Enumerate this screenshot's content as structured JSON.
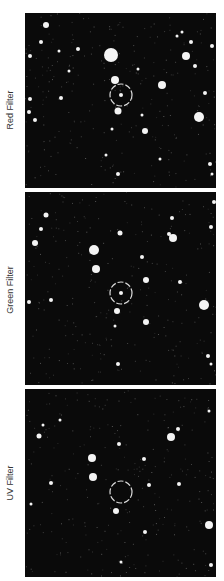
{
  "panels": [
    {
      "label": "Red Filter",
      "top": 13,
      "height": 175,
      "marker": {
        "cx": 96,
        "cy": 82,
        "r": 11
      },
      "stars": [
        [
          21,
          12,
          3
        ],
        [
          16,
          29,
          2
        ],
        [
          5,
          43,
          2
        ],
        [
          34,
          38,
          1.5
        ],
        [
          53,
          36,
          2
        ],
        [
          86,
          42,
          7
        ],
        [
          90,
          67,
          4
        ],
        [
          113,
          56,
          1.5
        ],
        [
          96,
          82,
          2
        ],
        [
          137,
          72,
          4
        ],
        [
          157,
          19,
          1.5
        ],
        [
          166,
          29,
          2
        ],
        [
          161,
          43,
          4
        ],
        [
          170,
          53,
          2
        ],
        [
          180,
          80,
          2
        ],
        [
          174,
          104,
          5
        ],
        [
          187,
          33,
          2
        ],
        [
          93,
          98,
          3.5
        ],
        [
          117,
          102,
          1.5
        ],
        [
          4,
          99,
          2
        ],
        [
          10,
          107,
          2
        ],
        [
          5,
          86,
          2
        ],
        [
          36,
          85,
          2
        ],
        [
          87,
          116,
          1.5
        ],
        [
          120,
          118,
          3
        ],
        [
          81,
          142,
          1.5
        ],
        [
          93,
          161,
          2
        ],
        [
          185,
          151,
          2
        ],
        [
          187,
          161,
          1.5
        ],
        [
          135,
          146,
          1.5
        ],
        [
          152,
          23,
          1.5
        ],
        [
          44,
          58,
          1.5
        ]
      ]
    },
    {
      "label": "Green Filter",
      "top": 192,
      "height": 193,
      "marker": {
        "cx": 96,
        "cy": 101,
        "r": 11
      },
      "stars": [
        [
          21,
          23,
          2.5
        ],
        [
          16,
          37,
          2
        ],
        [
          10,
          51,
          3
        ],
        [
          95,
          41,
          2.5
        ],
        [
          69,
          58,
          5
        ],
        [
          71,
          77,
          4
        ],
        [
          117,
          65,
          2
        ],
        [
          96,
          101,
          2
        ],
        [
          121,
          88,
          3
        ],
        [
          147,
          26,
          2
        ],
        [
          144,
          42,
          2
        ],
        [
          148,
          46,
          4
        ],
        [
          155,
          90,
          2
        ],
        [
          179,
          113,
          5
        ],
        [
          186,
          35,
          2
        ],
        [
          189,
          10,
          2
        ],
        [
          92,
          119,
          3
        ],
        [
          90,
          134,
          1.5
        ],
        [
          4,
          110,
          2
        ],
        [
          26,
          108,
          2
        ],
        [
          121,
          130,
          3
        ],
        [
          183,
          164,
          2
        ],
        [
          186,
          172,
          1.5
        ],
        [
          93,
          172,
          2
        ]
      ]
    },
    {
      "label": "UV Filter",
      "top": 389,
      "height": 188,
      "marker": {
        "cx": 96,
        "cy": 103,
        "r": 11
      },
      "stars": [
        [
          18,
          36,
          1.5
        ],
        [
          14,
          47,
          2.5
        ],
        [
          94,
          55,
          2
        ],
        [
          67,
          69,
          4
        ],
        [
          68,
          88,
          4
        ],
        [
          119,
          70,
          2
        ],
        [
          124,
          96,
          2
        ],
        [
          153,
          40,
          2
        ],
        [
          146,
          48,
          4
        ],
        [
          154,
          95,
          2
        ],
        [
          184,
          136,
          4
        ],
        [
          186,
          176,
          2
        ],
        [
          26,
          94,
          2
        ],
        [
          6,
          115,
          1.5
        ],
        [
          91,
          122,
          3
        ],
        [
          120,
          143,
          2
        ],
        [
          96,
          173,
          1.5
        ],
        [
          184,
          22,
          1.5
        ],
        [
          35,
          31,
          1.5
        ]
      ]
    }
  ]
}
